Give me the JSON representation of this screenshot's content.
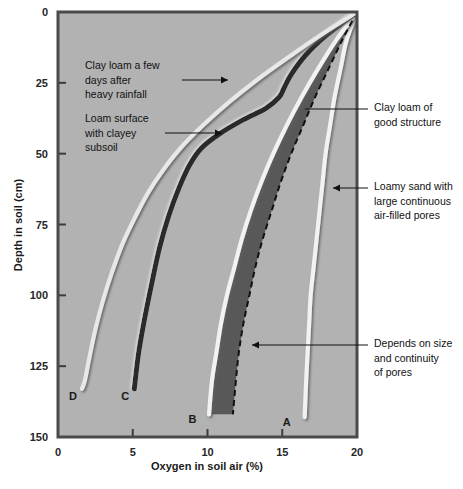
{
  "chart_data": {
    "type": "line",
    "title": "",
    "xlabel": "Oxygen in soil air (%)",
    "ylabel": "Depth in soil (cm)",
    "xlim": [
      0,
      20
    ],
    "ylim": [
      150,
      0
    ],
    "xticks": [
      "0",
      "5",
      "10",
      "15",
      "20"
    ],
    "yticks": [
      "0",
      "25",
      "50",
      "75",
      "100",
      "125",
      "150"
    ],
    "grid": false,
    "legend_position": "none",
    "y_axis_inverted": true,
    "plot_background": "#b2b2b2",
    "shaded_band_color": "#585858",
    "series": [
      {
        "name": "A",
        "label": "A",
        "style": "solid-light",
        "color": "#f2f2f2",
        "description": "Loamy sand with large continuous air-filled pores",
        "points": [
          {
            "x": 20.0,
            "y": 0
          },
          {
            "x": 19.3,
            "y": 10
          },
          {
            "x": 18.9,
            "y": 20
          },
          {
            "x": 18.5,
            "y": 30
          },
          {
            "x": 18.2,
            "y": 40
          },
          {
            "x": 17.9,
            "y": 50
          },
          {
            "x": 17.7,
            "y": 60
          },
          {
            "x": 17.5,
            "y": 70
          },
          {
            "x": 17.3,
            "y": 80
          },
          {
            "x": 17.1,
            "y": 90
          },
          {
            "x": 16.9,
            "y": 100
          },
          {
            "x": 16.8,
            "y": 110
          },
          {
            "x": 16.7,
            "y": 120
          },
          {
            "x": 16.6,
            "y": 130
          },
          {
            "x": 16.5,
            "y": 143
          }
        ]
      },
      {
        "name": "B",
        "label": "B",
        "style": "solid-light",
        "color": "#f2f2f2",
        "description": "Clay loam of good structure",
        "points": [
          {
            "x": 20.0,
            "y": 0
          },
          {
            "x": 18.6,
            "y": 10
          },
          {
            "x": 17.4,
            "y": 20
          },
          {
            "x": 16.3,
            "y": 30
          },
          {
            "x": 15.3,
            "y": 40
          },
          {
            "x": 14.4,
            "y": 50
          },
          {
            "x": 13.6,
            "y": 60
          },
          {
            "x": 12.9,
            "y": 70
          },
          {
            "x": 12.3,
            "y": 80
          },
          {
            "x": 11.8,
            "y": 90
          },
          {
            "x": 11.3,
            "y": 100
          },
          {
            "x": 10.9,
            "y": 110
          },
          {
            "x": 10.6,
            "y": 120
          },
          {
            "x": 10.3,
            "y": 130
          },
          {
            "x": 10.1,
            "y": 142
          }
        ]
      },
      {
        "name": "B-dashed",
        "label": "",
        "style": "dashed",
        "color": "#111111",
        "description": "Depends on size and continuity of pores",
        "points": [
          {
            "x": 20.0,
            "y": 0
          },
          {
            "x": 19.0,
            "y": 10
          },
          {
            "x": 18.1,
            "y": 20
          },
          {
            "x": 17.2,
            "y": 30
          },
          {
            "x": 16.4,
            "y": 40
          },
          {
            "x": 15.6,
            "y": 50
          },
          {
            "x": 14.9,
            "y": 60
          },
          {
            "x": 14.3,
            "y": 70
          },
          {
            "x": 13.7,
            "y": 80
          },
          {
            "x": 13.2,
            "y": 90
          },
          {
            "x": 12.8,
            "y": 100
          },
          {
            "x": 12.4,
            "y": 110
          },
          {
            "x": 12.1,
            "y": 120
          },
          {
            "x": 11.9,
            "y": 130
          },
          {
            "x": 11.7,
            "y": 142
          }
        ]
      },
      {
        "name": "C",
        "label": "C",
        "style": "solid-dark",
        "color": "#2b2b2b",
        "description": "Loam surface with clayey subsoil",
        "points": [
          {
            "x": 20.0,
            "y": 0
          },
          {
            "x": 18.0,
            "y": 8
          },
          {
            "x": 16.6,
            "y": 15
          },
          {
            "x": 15.6,
            "y": 22
          },
          {
            "x": 15.1,
            "y": 27
          },
          {
            "x": 14.8,
            "y": 30
          },
          {
            "x": 13.9,
            "y": 34
          },
          {
            "x": 12.4,
            "y": 38
          },
          {
            "x": 10.8,
            "y": 43
          },
          {
            "x": 9.6,
            "y": 48
          },
          {
            "x": 8.8,
            "y": 54
          },
          {
            "x": 8.1,
            "y": 62
          },
          {
            "x": 7.4,
            "y": 72
          },
          {
            "x": 6.8,
            "y": 83
          },
          {
            "x": 6.3,
            "y": 95
          },
          {
            "x": 5.8,
            "y": 108
          },
          {
            "x": 5.4,
            "y": 120
          },
          {
            "x": 5.1,
            "y": 133
          }
        ]
      },
      {
        "name": "D",
        "label": "D",
        "style": "solid-light",
        "color": "#e8e8e8",
        "description": "Clay loam a few days after heavy rainfall",
        "points": [
          {
            "x": 20.0,
            "y": 0
          },
          {
            "x": 17.6,
            "y": 8
          },
          {
            "x": 15.4,
            "y": 16
          },
          {
            "x": 13.3,
            "y": 24
          },
          {
            "x": 11.4,
            "y": 32
          },
          {
            "x": 9.7,
            "y": 40
          },
          {
            "x": 8.2,
            "y": 48
          },
          {
            "x": 7.0,
            "y": 56
          },
          {
            "x": 6.0,
            "y": 64
          },
          {
            "x": 5.1,
            "y": 73
          },
          {
            "x": 4.3,
            "y": 82
          },
          {
            "x": 3.6,
            "y": 92
          },
          {
            "x": 3.0,
            "y": 102
          },
          {
            "x": 2.5,
            "y": 112
          },
          {
            "x": 2.1,
            "y": 122
          },
          {
            "x": 1.8,
            "y": 130
          },
          {
            "x": 1.6,
            "y": 133
          }
        ]
      }
    ],
    "shaded_region": {
      "name": "oxygen-deficit-band",
      "between": [
        "B",
        "B-dashed"
      ],
      "color": "#585858"
    },
    "annotations": [
      {
        "name": "annotation-clay-loam-rainfall",
        "lines": [
          "Clay loam a few",
          "days after",
          "heavy rainfall"
        ],
        "side": "left",
        "target_series": "D"
      },
      {
        "name": "annotation-loam-surface",
        "lines": [
          "Loam surface",
          "with clayey",
          "subsoil"
        ],
        "side": "left",
        "target_series": "C"
      },
      {
        "name": "annotation-clay-loam-structure",
        "lines": [
          "Clay loam of",
          "good structure"
        ],
        "side": "right",
        "target_series": "B"
      },
      {
        "name": "annotation-loamy-sand",
        "lines": [
          "Loamy sand with",
          "large continuous",
          "air-filled pores"
        ],
        "side": "right",
        "target_series": "A"
      },
      {
        "name": "annotation-depends-on-pores",
        "lines": [
          "Depends on size",
          "and continuity",
          "of pores"
        ],
        "side": "right",
        "target_series": "shaded-band"
      }
    ],
    "curve_labels": [
      {
        "label": "D",
        "x": 1.6,
        "y": 137
      },
      {
        "label": "C",
        "x": 5.1,
        "y": 137
      },
      {
        "label": "B",
        "x": 9.6,
        "y": 145
      },
      {
        "label": "A",
        "x": 15.9,
        "y": 146
      }
    ]
  }
}
